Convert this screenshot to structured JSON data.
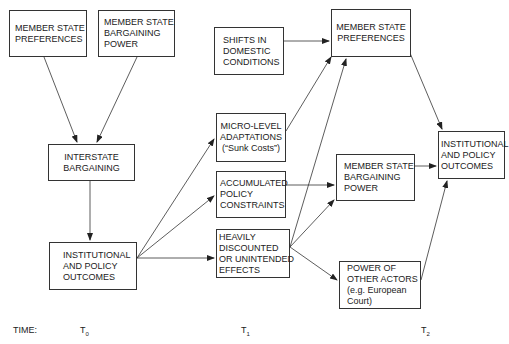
{
  "boxes": {
    "ms_pref_t0": {
      "lines": [
        "MEMBER STATE",
        "PREFERENCES"
      ]
    },
    "ms_power_t0": {
      "lines": [
        "MEMBER STATE",
        "BARGAINING",
        "POWER"
      ]
    },
    "interstate": {
      "lines": [
        "INTERSTATE",
        "BARGAINING"
      ]
    },
    "outcomes_t0": {
      "lines": [
        "INSTITUTIONAL",
        "AND POLICY",
        "OUTCOMES"
      ]
    },
    "shifts": {
      "lines": [
        "SHIFTS IN",
        "DOMESTIC",
        "CONDITIONS"
      ]
    },
    "micro": {
      "lines": [
        "MICRO-LEVEL",
        "ADAPTATIONS",
        "(“Sunk Costs”)"
      ]
    },
    "accumulated": {
      "lines": [
        "ACCUMULATED",
        "POLICY",
        "CONSTRAINTS"
      ]
    },
    "heavily": {
      "lines": [
        "HEAVILY",
        "DISCOUNTED",
        "OR UNINTENDED",
        "EFFECTS"
      ]
    },
    "ms_pref_t2": {
      "lines": [
        "MEMBER STATE",
        "PREFERENCES"
      ]
    },
    "ms_power_t2": {
      "lines": [
        "MEMBER STATE",
        "BARGAINING",
        "POWER"
      ]
    },
    "other_actors": {
      "lines": [
        "POWER OF",
        "OTHER ACTORS",
        "(e.g. European",
        "Court)"
      ]
    },
    "outcomes_t2": {
      "lines": [
        "INSTITUTIONAL",
        "AND POLICY",
        "OUTCOMES"
      ]
    }
  },
  "timeline": {
    "label": "TIME:",
    "t0": {
      "base": "T",
      "sub": "0"
    },
    "t1": {
      "base": "T",
      "sub": "1"
    },
    "t2": {
      "base": "T",
      "sub": "2"
    }
  },
  "colors": {
    "line": "#333333",
    "background": "#ffffff"
  }
}
